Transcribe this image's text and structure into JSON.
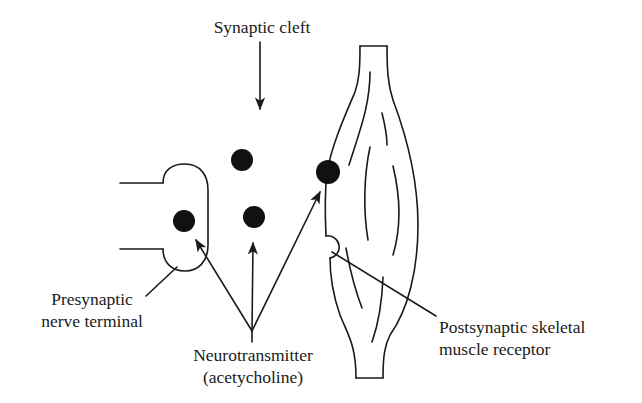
{
  "diagram": {
    "type": "labeled-schematic",
    "labels": {
      "synaptic_cleft": "Synaptic cleft",
      "presynaptic_line1": "Presynaptic",
      "presynaptic_line2": "nerve terminal",
      "neurotransmitter_line1": "Neurotransmitter",
      "neurotransmitter_line2": "(acetycholine)",
      "postsynaptic_line1": "Postsynaptic skeletal",
      "postsynaptic_line2": "muscle receptor"
    },
    "components": [
      {
        "id": "presynaptic-nerve-terminal",
        "shape": "axon with bulbous terminal",
        "position": "left"
      },
      {
        "id": "synaptic-cleft",
        "shape": "gap between terminal and muscle",
        "position": "center"
      },
      {
        "id": "skeletal-muscle",
        "shape": "spindle-shaped fiber with striations",
        "position": "right"
      },
      {
        "id": "postsynaptic-receptor",
        "shape": "semicircular notch on muscle surface",
        "position": "right, lower"
      }
    ],
    "neurotransmitter_molecules": [
      {
        "id": "molecule-in-terminal",
        "cx": 184,
        "cy": 221,
        "r": 11
      },
      {
        "id": "molecule-cleft-upper",
        "cx": 242,
        "cy": 160,
        "r": 11
      },
      {
        "id": "molecule-cleft-lower",
        "cx": 254,
        "cy": 217,
        "r": 11
      },
      {
        "id": "molecule-bound-to-muscle",
        "cx": 328,
        "cy": 172,
        "r": 12
      }
    ],
    "arrows": [
      {
        "from": "Synaptic cleft label",
        "to": "synaptic cleft"
      },
      {
        "from": "Neurotransmitter label",
        "to": "molecule-in-terminal"
      },
      {
        "from": "Neurotransmitter label",
        "to": "molecule-cleft-lower"
      },
      {
        "from": "Neurotransmitter label",
        "to": "molecule-bound-to-muscle"
      }
    ],
    "leader_lines": [
      {
        "from": "Presynaptic nerve terminal label",
        "to": "presynaptic terminal"
      },
      {
        "from": "Postsynaptic skeletal muscle receptor label",
        "to": "receptor notch"
      }
    ],
    "colors": {
      "ink": "#1a1a1a",
      "background": "#ffffff"
    }
  }
}
